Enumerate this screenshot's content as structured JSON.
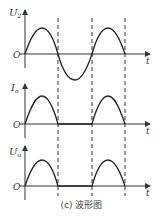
{
  "caption": "(c) 波形图",
  "panels": [
    {
      "ylabel": "U",
      "ysub": "2",
      "origin": "O",
      "xlabel": "t",
      "waveform": "full sine"
    },
    {
      "ylabel": "I",
      "ysub": "o",
      "origin": "O",
      "xlabel": "t",
      "waveform": "half-wave rectified"
    },
    {
      "ylabel": "U",
      "ysub": "o",
      "origin": "O",
      "xlabel": "t",
      "waveform": "half-wave rectified"
    }
  ],
  "dashed_lines_at": [
    "π",
    "2π",
    "3π"
  ]
}
